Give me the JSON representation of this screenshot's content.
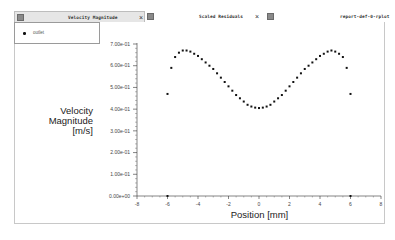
{
  "tabs": [
    {
      "label": "Velocity Magnitude",
      "active": true,
      "icon": "window-icon",
      "closable": true
    },
    {
      "label": "Scaled Residuals",
      "active": false,
      "icon": "window-icon",
      "closable": true
    },
    {
      "label": "report-def-0-rplot",
      "active": false,
      "icon": "window-icon",
      "closable": false
    }
  ],
  "legend": {
    "items": [
      {
        "label": "outlet",
        "marker": "dot"
      }
    ]
  },
  "plot": {
    "ylabel_lines": [
      "Velocity",
      "Magnitude",
      "[m/s]"
    ],
    "xlabel": "Position [mm]",
    "yticks": [
      "7.00e-01",
      "6.00e-01",
      "5.00e-01",
      "4.00e-01",
      "3.00e-01",
      "2.00e-01",
      "1.00e-01",
      "0.00e+00"
    ],
    "xticks": [
      "-8",
      "-6",
      "-4",
      "-2",
      "0",
      "2",
      "4",
      "6",
      "8"
    ]
  },
  "chart_data": {
    "type": "scatter",
    "title": "Velocity Magnitude",
    "xlabel": "Position [mm]",
    "ylabel": "Velocity Magnitude [m/s]",
    "xlim": [
      -8,
      8
    ],
    "ylim": [
      0,
      0.7
    ],
    "grid": false,
    "legend_position": "top-left",
    "series": [
      {
        "name": "outlet",
        "x": [
          -6.0,
          -6.0,
          -5.75,
          -5.5,
          -5.25,
          -5.0,
          -4.75,
          -4.5,
          -4.25,
          -4.0,
          -3.75,
          -3.5,
          -3.25,
          -3.0,
          -2.75,
          -2.5,
          -2.25,
          -2.0,
          -1.75,
          -1.5,
          -1.25,
          -1.0,
          -0.75,
          -0.5,
          -0.25,
          0.0,
          0.25,
          0.5,
          0.75,
          1.0,
          1.25,
          1.5,
          1.75,
          2.0,
          2.25,
          2.5,
          2.75,
          3.0,
          3.25,
          3.5,
          3.75,
          4.0,
          4.25,
          4.5,
          4.75,
          5.0,
          5.25,
          5.5,
          5.75,
          6.0,
          6.0
        ],
        "y": [
          0.0,
          0.47,
          0.59,
          0.64,
          0.66,
          0.67,
          0.67,
          0.665,
          0.655,
          0.645,
          0.63,
          0.615,
          0.6,
          0.585,
          0.565,
          0.545,
          0.525,
          0.505,
          0.485,
          0.465,
          0.45,
          0.435,
          0.42,
          0.412,
          0.407,
          0.405,
          0.407,
          0.412,
          0.42,
          0.435,
          0.45,
          0.465,
          0.485,
          0.505,
          0.525,
          0.545,
          0.565,
          0.585,
          0.6,
          0.615,
          0.63,
          0.645,
          0.655,
          0.665,
          0.67,
          0.665,
          0.655,
          0.64,
          0.59,
          0.47,
          0.0
        ]
      }
    ]
  }
}
